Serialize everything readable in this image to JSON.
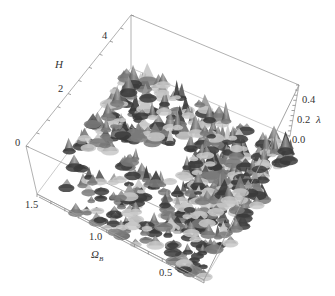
{
  "chart_data": {
    "type": "surface3d",
    "title": "",
    "axes": {
      "H": {
        "label": "H",
        "ticks": [
          "0",
          "2",
          "4"
        ],
        "range": [
          0,
          5
        ]
      },
      "lambda": {
        "label": "λ",
        "ticks": [
          "0.0",
          "0.2",
          "0.4"
        ],
        "range": [
          0,
          0.5
        ]
      },
      "omega": {
        "label": "Ω_B",
        "label_main": "Ω",
        "label_sub": "B",
        "ticks": [
          "1.5",
          "1.0",
          "0.5"
        ],
        "range": [
          0.4,
          1.6
        ]
      }
    },
    "grid": false,
    "legend": null
  },
  "surface": {
    "fill_dark": "#3a3a3a",
    "fill_mid": "#7a7a7a",
    "fill_light": "#c8c8c8",
    "box_color": "#9a9a9a"
  }
}
